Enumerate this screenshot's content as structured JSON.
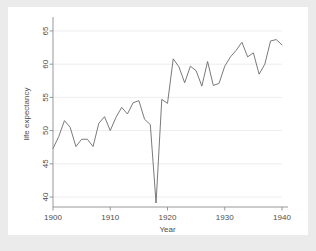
{
  "chart_data": {
    "type": "line",
    "title": "",
    "xlabel": "Year",
    "ylabel": "life expectancy",
    "xlim": [
      1900,
      1940
    ],
    "ylim": [
      38.5,
      66.5
    ],
    "xticks": [
      1900,
      1910,
      1920,
      1930,
      1940
    ],
    "yticks": [
      40,
      45,
      50,
      55,
      60,
      65
    ],
    "grid": "horizontal",
    "legend": "none",
    "series": [
      {
        "name": "life expectancy",
        "x": [
          1900,
          1901,
          1902,
          1903,
          1904,
          1905,
          1906,
          1907,
          1908,
          1909,
          1910,
          1911,
          1912,
          1913,
          1914,
          1915,
          1916,
          1917,
          1918,
          1919,
          1920,
          1921,
          1922,
          1923,
          1924,
          1925,
          1926,
          1927,
          1928,
          1929,
          1930,
          1931,
          1932,
          1933,
          1934,
          1935,
          1936,
          1937,
          1938,
          1939,
          1940
        ],
        "values": [
          47.3,
          49.1,
          51.5,
          50.5,
          47.6,
          48.7,
          48.7,
          47.6,
          51.1,
          52.1,
          50.0,
          52.0,
          53.5,
          52.5,
          54.2,
          54.5,
          51.7,
          50.9,
          39.1,
          54.7,
          54.1,
          60.8,
          59.6,
          57.2,
          59.7,
          59.0,
          56.7,
          60.4,
          56.8,
          57.1,
          59.7,
          61.1,
          62.1,
          63.3,
          61.1,
          61.7,
          58.5,
          60.0,
          63.5,
          63.7,
          62.9
        ]
      }
    ]
  },
  "axis": {
    "x_tick_labels": [
      "1900",
      "1910",
      "1920",
      "1930",
      "1940"
    ],
    "y_tick_labels": [
      "40",
      "45",
      "50",
      "55",
      "60",
      "65"
    ],
    "x_title": "Year",
    "y_title": "life expectancy"
  },
  "style": {
    "figure_background": "#ebebeb",
    "plot_background": "#ffffff",
    "line_color": "#6b6b6b",
    "grid_color": "#e8e8e8",
    "axis_color": "#8c8c8c",
    "text_color": "#4d4d4d"
  }
}
